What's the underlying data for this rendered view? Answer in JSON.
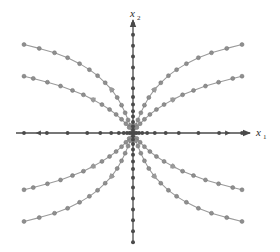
{
  "figure": {
    "title": "",
    "background_color": "#ffffff",
    "axis_color": "#4a4a4a",
    "trajectory_color": "#9a9a9a",
    "marker_color": "#8f8f8f",
    "marker_edge_color": "#6f6f6f"
  },
  "axes": {
    "x_axis": {
      "label": "x",
      "subscript": "1",
      "label_name": "x-axis-label",
      "arrow": "right",
      "origin_px": [
        133,
        133
      ],
      "left_end_px": 16,
      "right_end_px": 242
    },
    "y_axis": {
      "label": "x",
      "subscript": "2",
      "label_name": "y-axis-label",
      "arrow": "up",
      "origin_px": [
        133,
        133
      ],
      "top_end_px": 26,
      "bottom_end_px": 243
    }
  },
  "chart_data": {
    "type": "scatter",
    "xlabel": "x1",
    "ylabel": "x2",
    "xlim": [
      -1.15,
      1.05
    ],
    "ylim": [
      -1.05,
      1.05
    ],
    "grid": false,
    "legend": "none",
    "annotations": [
      "trajectories emanate outward from origin",
      "flow is tangent to the vertical axis near the origin",
      "equilibrium sample points marked along both axes"
    ],
    "axis_marker_points": {
      "description": "dots along x1 axis (y=0), x-values in data units",
      "x1_values": [
        -1.0,
        -0.79,
        -0.6,
        -0.42,
        -0.3,
        -0.2,
        -0.13,
        -0.085,
        -0.055,
        -0.032,
        -0.015,
        0.015,
        0.032,
        0.055,
        0.085,
        0.13,
        0.2,
        0.3,
        0.42,
        0.6,
        0.79,
        1.0
      ],
      "description_y": "dots along x2 axis (x=0), y-values in data units",
      "x2_values": [
        -1.0,
        -0.9,
        -0.8,
        -0.7,
        -0.6,
        -0.5,
        -0.41,
        -0.33,
        -0.26,
        -0.2,
        -0.15,
        -0.1,
        -0.06,
        -0.03,
        0.03,
        0.06,
        0.1,
        0.15,
        0.2,
        0.26,
        0.33,
        0.41,
        0.5,
        0.6,
        0.7,
        0.8,
        0.9,
        1.0
      ]
    },
    "series": [
      {
        "name": "traj-upper-left-outer",
        "quadrant": "II",
        "arrow_direction": "outward-left",
        "arrow_at_index": 6,
        "points": [
          [
            -0.012,
            0.03
          ],
          [
            -0.025,
            0.07
          ],
          [
            -0.045,
            0.12
          ],
          [
            -0.072,
            0.185
          ],
          [
            -0.105,
            0.255
          ],
          [
            -0.145,
            0.325
          ],
          [
            -0.195,
            0.395
          ],
          [
            -0.255,
            0.46
          ],
          [
            -0.325,
            0.525
          ],
          [
            -0.4,
            0.58
          ],
          [
            -0.49,
            0.635
          ],
          [
            -0.6,
            0.69
          ],
          [
            -0.72,
            0.735
          ],
          [
            -0.86,
            0.775
          ],
          [
            -1.0,
            0.81
          ]
        ]
      },
      {
        "name": "traj-upper-left-inner",
        "quadrant": "II",
        "arrow_direction": "outward-left",
        "arrow_at_index": 7,
        "points": [
          [
            -0.015,
            0.02
          ],
          [
            -0.035,
            0.05
          ],
          [
            -0.065,
            0.085
          ],
          [
            -0.105,
            0.125
          ],
          [
            -0.155,
            0.17
          ],
          [
            -0.215,
            0.215
          ],
          [
            -0.285,
            0.26
          ],
          [
            -0.365,
            0.305
          ],
          [
            -0.455,
            0.35
          ],
          [
            -0.555,
            0.39
          ],
          [
            -0.665,
            0.43
          ],
          [
            -0.785,
            0.465
          ],
          [
            -0.915,
            0.5
          ],
          [
            -1.0,
            0.52
          ]
        ]
      },
      {
        "name": "traj-upper-right-outer",
        "quadrant": "I",
        "arrow_direction": "outward-right",
        "arrow_at_index": 6,
        "points": [
          [
            0.012,
            0.03
          ],
          [
            0.025,
            0.07
          ],
          [
            0.045,
            0.12
          ],
          [
            0.072,
            0.185
          ],
          [
            0.105,
            0.255
          ],
          [
            0.145,
            0.325
          ],
          [
            0.195,
            0.395
          ],
          [
            0.255,
            0.46
          ],
          [
            0.325,
            0.525
          ],
          [
            0.4,
            0.58
          ],
          [
            0.49,
            0.635
          ],
          [
            0.6,
            0.69
          ],
          [
            0.72,
            0.735
          ],
          [
            0.86,
            0.775
          ],
          [
            1.0,
            0.81
          ]
        ]
      },
      {
        "name": "traj-upper-right-inner",
        "quadrant": "I",
        "arrow_direction": "outward-right",
        "arrow_at_index": 7,
        "points": [
          [
            0.015,
            0.02
          ],
          [
            0.035,
            0.05
          ],
          [
            0.065,
            0.085
          ],
          [
            0.105,
            0.125
          ],
          [
            0.155,
            0.17
          ],
          [
            0.215,
            0.215
          ],
          [
            0.285,
            0.26
          ],
          [
            0.365,
            0.305
          ],
          [
            0.455,
            0.35
          ],
          [
            0.555,
            0.39
          ],
          [
            0.665,
            0.43
          ],
          [
            0.785,
            0.465
          ],
          [
            0.915,
            0.5
          ],
          [
            1.0,
            0.52
          ]
        ]
      },
      {
        "name": "traj-lower-left-inner",
        "quadrant": "III",
        "arrow_direction": "outward-left",
        "arrow_at_index": 7,
        "points": [
          [
            -0.015,
            -0.02
          ],
          [
            -0.035,
            -0.05
          ],
          [
            -0.065,
            -0.085
          ],
          [
            -0.105,
            -0.125
          ],
          [
            -0.155,
            -0.17
          ],
          [
            -0.215,
            -0.215
          ],
          [
            -0.285,
            -0.26
          ],
          [
            -0.365,
            -0.305
          ],
          [
            -0.455,
            -0.35
          ],
          [
            -0.555,
            -0.39
          ],
          [
            -0.665,
            -0.43
          ],
          [
            -0.785,
            -0.465
          ],
          [
            -0.915,
            -0.5
          ],
          [
            -1.0,
            -0.52
          ]
        ]
      },
      {
        "name": "traj-lower-left-outer",
        "quadrant": "III",
        "arrow_direction": "outward-left",
        "arrow_at_index": 6,
        "points": [
          [
            -0.012,
            -0.03
          ],
          [
            -0.025,
            -0.07
          ],
          [
            -0.045,
            -0.12
          ],
          [
            -0.072,
            -0.185
          ],
          [
            -0.105,
            -0.255
          ],
          [
            -0.145,
            -0.325
          ],
          [
            -0.195,
            -0.395
          ],
          [
            -0.255,
            -0.46
          ],
          [
            -0.325,
            -0.525
          ],
          [
            -0.4,
            -0.58
          ],
          [
            -0.49,
            -0.635
          ],
          [
            -0.6,
            -0.69
          ],
          [
            -0.72,
            -0.735
          ],
          [
            -0.86,
            -0.775
          ],
          [
            -1.0,
            -0.81
          ]
        ]
      },
      {
        "name": "traj-lower-right-inner",
        "quadrant": "IV",
        "arrow_direction": "outward-right",
        "arrow_at_index": 7,
        "points": [
          [
            0.015,
            -0.02
          ],
          [
            0.035,
            -0.05
          ],
          [
            0.065,
            -0.085
          ],
          [
            0.105,
            -0.125
          ],
          [
            0.155,
            -0.17
          ],
          [
            0.215,
            -0.215
          ],
          [
            0.285,
            -0.26
          ],
          [
            0.365,
            -0.305
          ],
          [
            0.455,
            -0.35
          ],
          [
            0.555,
            -0.39
          ],
          [
            0.665,
            -0.43
          ],
          [
            0.785,
            -0.465
          ],
          [
            0.915,
            -0.5
          ],
          [
            1.0,
            -0.52
          ]
        ]
      },
      {
        "name": "traj-lower-right-outer",
        "quadrant": "IV",
        "arrow_direction": "outward-right",
        "arrow_at_index": 6,
        "points": [
          [
            0.012,
            -0.03
          ],
          [
            0.025,
            -0.07
          ],
          [
            0.045,
            -0.12
          ],
          [
            0.072,
            -0.185
          ],
          [
            0.105,
            -0.255
          ],
          [
            0.145,
            -0.325
          ],
          [
            0.195,
            -0.395
          ],
          [
            0.255,
            -0.46
          ],
          [
            0.325,
            -0.525
          ],
          [
            0.4,
            -0.58
          ],
          [
            0.49,
            -0.635
          ],
          [
            0.6,
            -0.69
          ],
          [
            0.72,
            -0.735
          ],
          [
            0.86,
            -0.775
          ],
          [
            1.0,
            -0.81
          ]
        ]
      }
    ]
  }
}
